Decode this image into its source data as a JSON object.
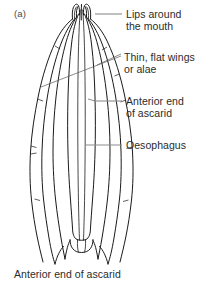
{
  "figure": {
    "panel_label": "(a)",
    "caption": "Anterior end of ascarid",
    "subject": "Anterior end of ascarid",
    "type": "biological-line-diagram",
    "line_color": "#1a1a1a",
    "leader_color": "#8c8c8c",
    "text_color": "#2b2b2b",
    "background": "#ffffff"
  },
  "callouts": [
    {
      "id": "lips",
      "text": "Lips around\nthe mouth",
      "lines": [
        "Lips around",
        "the mouth"
      ],
      "leader": "horizontal",
      "points_to": "mouth-lips"
    },
    {
      "id": "alae",
      "text": "Thin, flat  wings\nor alae",
      "lines": [
        "Thin, flat  wings",
        "or alae"
      ],
      "leader": "two-diagonal",
      "points_to": "lateral-alae"
    },
    {
      "id": "anterior",
      "text": "Anterior end\nof ascarid",
      "lines": [
        "Anterior end",
        "of ascarid"
      ],
      "leader": "horizontal",
      "points_to": "body-wall"
    },
    {
      "id": "oesophagus",
      "text": "Oesophagus",
      "lines": [
        "Oesophagus"
      ],
      "leader": "horizontal",
      "points_to": "oesophagus-tube"
    }
  ],
  "anatomy_parts": [
    "mouth-lips",
    "lateral-alae",
    "body-wall",
    "oesophagus-tube",
    "oesophageal-bulb"
  ]
}
